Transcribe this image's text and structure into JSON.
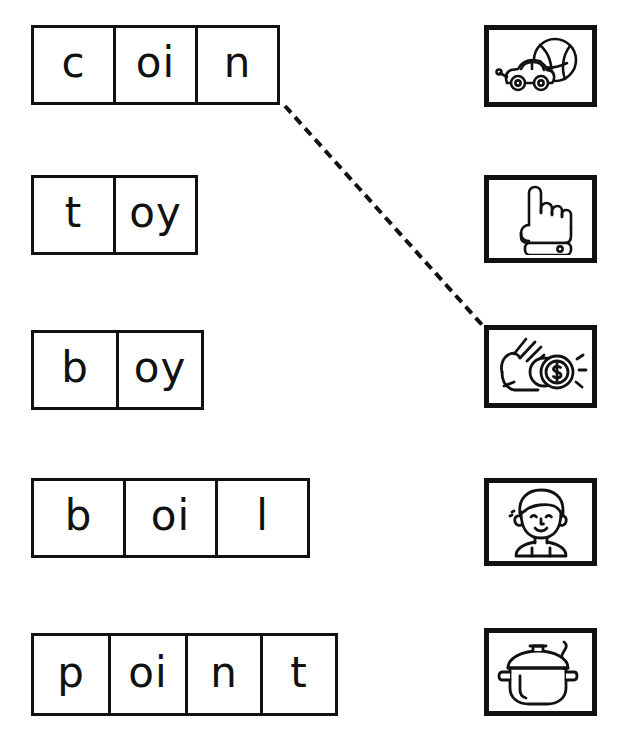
{
  "worksheet": {
    "title": "oi / oy word-to-picture matching worksheet",
    "ink_color": "#111111",
    "page_color": "#ffffff",
    "word_rows": [
      {
        "name": "coin",
        "word": "coin",
        "cells": [
          "c",
          "oi",
          "n"
        ],
        "cell_widths": [
          85,
          85,
          85
        ],
        "x": 31,
        "y": 25,
        "height": 80
      },
      {
        "name": "toy",
        "word": "toy",
        "cells": [
          "t",
          "oy"
        ],
        "cell_widths": [
          85,
          85
        ],
        "x": 31,
        "y": 175,
        "height": 80
      },
      {
        "name": "boy",
        "word": "boy",
        "cells": [
          "b",
          "oy"
        ],
        "cell_widths": [
          88,
          88
        ],
        "x": 31,
        "y": 330,
        "height": 80
      },
      {
        "name": "boil",
        "word": "boil",
        "cells": [
          "b",
          "oi",
          "l"
        ],
        "cell_widths": [
          95,
          95,
          95
        ],
        "x": 31,
        "y": 478,
        "height": 80
      },
      {
        "name": "point",
        "word": "point",
        "cells": [
          "p",
          "oi",
          "n",
          "t"
        ],
        "cell_widths": [
          80,
          80,
          78,
          78
        ],
        "x": 31,
        "y": 633,
        "height": 83
      }
    ],
    "picture_boxes": [
      {
        "name": "toy-picture",
        "icon": "toy-car-and-ball-icon",
        "answer_word": "toy",
        "x": 484,
        "y": 25,
        "width": 113,
        "height": 82
      },
      {
        "name": "point-picture",
        "icon": "pointing-hand-icon",
        "answer_word": "point",
        "x": 484,
        "y": 175,
        "width": 113,
        "height": 88
      },
      {
        "name": "coin-picture",
        "icon": "hand-holding-coin-icon",
        "answer_word": "coin",
        "x": 484,
        "y": 325,
        "width": 113,
        "height": 83
      },
      {
        "name": "boy-picture",
        "icon": "boy-face-icon",
        "answer_word": "boy",
        "x": 484,
        "y": 478,
        "width": 113,
        "height": 88
      },
      {
        "name": "boil-picture",
        "icon": "steaming-pot-icon",
        "answer_word": "boil",
        "x": 484,
        "y": 628,
        "width": 113,
        "height": 88
      }
    ],
    "connector_lines": [
      {
        "name": "connector-coin-to-coin-picture",
        "from_word": "coin",
        "to_picture": "coin-picture",
        "style": "dashed",
        "x1": 285,
        "y1": 106,
        "x2": 484,
        "y2": 327,
        "stroke_width": 4,
        "dash": "9 6"
      }
    ]
  }
}
